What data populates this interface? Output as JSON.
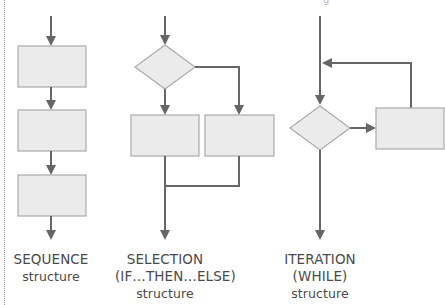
{
  "colors": {
    "line": "#666666",
    "box_fill": "#ebebeb",
    "box_border": "#aaaaaa",
    "text": "#4a4a4a"
  },
  "diagrams": {
    "sequence": {
      "title": "SEQUENCE",
      "subtitle": "structure",
      "boxes": 3
    },
    "selection": {
      "title": "SELECTION",
      "condition": "(IF…THEN…ELSE)",
      "subtitle": "structure",
      "decisions": 1,
      "boxes": 2
    },
    "iteration": {
      "title": "ITERATION",
      "condition": "(WHILE)",
      "subtitle": "structure",
      "decisions": 1,
      "boxes": 1
    }
  },
  "top_fragment": "g"
}
